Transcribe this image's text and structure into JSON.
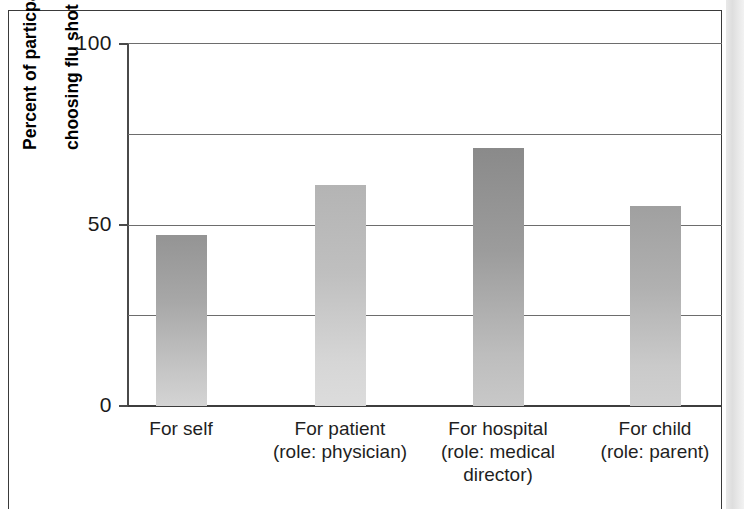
{
  "figure": {
    "background_color": "#ffffff",
    "frame_color": "#3a3a3a",
    "page_edge_artifact": true
  },
  "chart_data": {
    "type": "bar",
    "title": "",
    "subtitle": "",
    "xlabel": "",
    "ylabel": "Percent of particpants choosing flu shot",
    "ylabel_lines": [
      "Percent of particpants",
      "choosing flu shot"
    ],
    "categories": [
      "For self",
      "For patient (role: physician)",
      "For hospital (role: medical director)",
      "For child (role: parent)"
    ],
    "category_lines": [
      [
        "For self"
      ],
      [
        "For patient",
        "(role: physician)"
      ],
      [
        "For hospital",
        "(role: medical",
        "director)"
      ],
      [
        "For child",
        "(role: parent)"
      ]
    ],
    "values": [
      47,
      61,
      71,
      55
    ],
    "ylim": [
      0,
      100
    ],
    "ytick_labels": [
      "0",
      "50",
      "100"
    ],
    "ytick_values": [
      0,
      50,
      100
    ],
    "gridline_values": [
      25,
      50,
      75,
      100
    ],
    "grid": true,
    "grid_color": "#6d6d6d",
    "legend": null,
    "legend_position": "none",
    "bar_colors_top": [
      "#949494",
      "#b4b4b4",
      "#8a8a8a",
      "#a0a0a0"
    ],
    "bar_colors_bottom": [
      "#d4d4d4",
      "#dcdcdc",
      "#c8c8c8",
      "#d0d0d0"
    ]
  }
}
